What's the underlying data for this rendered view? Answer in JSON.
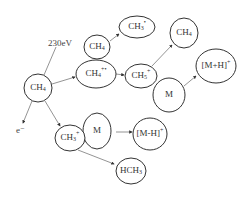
{
  "diagram": {
    "energy_label": "230eV",
    "electron_label": "e⁻",
    "nodes": {
      "ch4_source": {
        "base": "CH",
        "sub": "4",
        "sup": ""
      },
      "ch4_neutral": {
        "base": "CH",
        "sub": "4",
        "sup": ""
      },
      "ch4_ion": {
        "base": "CH",
        "sub": "4",
        "sup": "+•"
      },
      "ch3_radical": {
        "base": "CH",
        "sub": "3",
        "sup": "•"
      },
      "ch5_ion": {
        "base": "CH",
        "sub": "5",
        "sup": "+"
      },
      "m_upper": {
        "base": "M",
        "sub": "",
        "sup": ""
      },
      "ch4_product": {
        "base": "CH",
        "sub": "4",
        "sup": ""
      },
      "mh_plus": {
        "base": "[M+H]",
        "sub": "",
        "sup": "+"
      },
      "ch3_ion": {
        "base": "CH",
        "sub": "3",
        "sup": "+"
      },
      "m_lower": {
        "base": "M",
        "sub": "",
        "sup": ""
      },
      "m_minus_h": {
        "base": "[M-H]",
        "sub": "",
        "sup": "+"
      },
      "hch3": {
        "base": "HCH",
        "sub": "3",
        "sup": ""
      }
    }
  }
}
